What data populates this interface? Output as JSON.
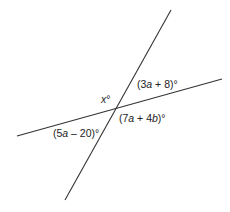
{
  "diagram": {
    "type": "intersecting-lines-angles",
    "line_color": "#333333",
    "lines": [
      {
        "name": "steep-line",
        "x1": 171,
        "y1": 10,
        "x2": 65,
        "y2": 200
      },
      {
        "name": "shallow-line",
        "x1": 17,
        "y1": 136,
        "x2": 222,
        "y2": 79
      }
    ],
    "intersection": {
      "x": 116,
      "y": 109
    },
    "labels": {
      "top_left": {
        "var": "x",
        "suffix": "°"
      },
      "top_right": {
        "prefix": "(3",
        "var": "a",
        "suffix": " + 8)°"
      },
      "bottom_right": {
        "prefix": "(7",
        "var1": "a",
        "mid": " + 4",
        "var2": "b",
        "suffix": ")°"
      },
      "bottom_left": {
        "prefix": "(5",
        "var": "a",
        "suffix": " – 20)°"
      }
    }
  }
}
